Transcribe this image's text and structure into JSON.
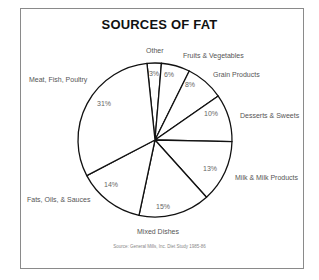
{
  "chart_data": {
    "type": "pie",
    "title": "SOURCES OF FAT",
    "start_angle_deg": -6,
    "direction": "clockwise",
    "slices": [
      {
        "label": "Other",
        "value": 3,
        "pct_label": "3%"
      },
      {
        "label": "Fruits & Vegetables",
        "value": 6,
        "pct_label": "6%"
      },
      {
        "label": "Grain Products",
        "value": 8,
        "pct_label": "8%"
      },
      {
        "label": "Desserts & Sweets",
        "value": 10,
        "pct_label": "10%"
      },
      {
        "label": "Milk & Milk Products",
        "value": 13,
        "pct_label": "13%"
      },
      {
        "label": "Mixed Dishes",
        "value": 15,
        "pct_label": "15%"
      },
      {
        "label": "Fats, Oils, & Sauces",
        "value": 14,
        "pct_label": "14%"
      },
      {
        "label": "Meat, Fish, Poultry",
        "value": 31,
        "pct_label": "31%"
      }
    ],
    "source": "Source: General Mills, Inc. Diet Study 1985-86",
    "legend": "none (external slice labels)",
    "colors": {
      "fill": "#ffffff",
      "stroke": "#111111"
    }
  },
  "labels": {
    "title": "SOURCES OF FAT",
    "source": "Source: General Mills, Inc. Diet Study 1985-86",
    "other": "Other",
    "fruits": "Fruits & Vegetables",
    "grain": "Grain Products",
    "desserts": "Desserts & Sweets",
    "milk": "Milk & Milk Products",
    "mixed": "Mixed Dishes",
    "fats": "Fats, Oils, & Sauces",
    "meat": "Meat, Fish, Poultry",
    "pct_other": "3%",
    "pct_fruits": "6%",
    "pct_grain": "8%",
    "pct_desserts": "10%",
    "pct_milk": "13%",
    "pct_mixed": "15%",
    "pct_fats": "14%",
    "pct_meat": "31%"
  }
}
